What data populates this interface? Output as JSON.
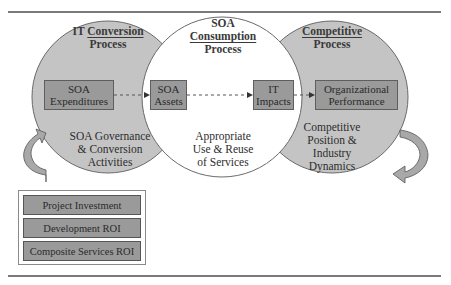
{
  "diagram": {
    "colors": {
      "circle_fill": "#c4c4c4",
      "middle_circle_fill": "#ffffff",
      "circle_stroke": "#6a6a6a",
      "box_fill": "#9a9a9a",
      "box_stroke": "#5e5e5e",
      "arrow_fill": "#a8a8a8",
      "rule": "#7a7a7a"
    },
    "circles": [
      {
        "id": "it-conversion",
        "title_line1_prefix": "IT ",
        "title_line1_underlined": "Conversion",
        "title_line2": "Process",
        "description": [
          "SOA Governance",
          "& Conversion",
          "Activities"
        ]
      },
      {
        "id": "soa-consumption",
        "title_line1": "SOA",
        "title_line2_underlined": "Consumption",
        "title_line3": "Process",
        "description": [
          "Appropriate",
          "Use & Reuse",
          "of Services"
        ]
      },
      {
        "id": "competitive",
        "title_line1_underlined": "Competitive",
        "title_line2": "Process",
        "description": [
          "Competitive",
          "Position &",
          "Industry",
          "Dynamics"
        ]
      }
    ],
    "boxes": [
      {
        "id": "soa-expenditures",
        "lines": [
          "SOA",
          "Expenditures"
        ]
      },
      {
        "id": "soa-assets",
        "lines": [
          "SOA",
          "Assets"
        ]
      },
      {
        "id": "it-impacts",
        "lines": [
          "IT",
          "Impacts"
        ]
      },
      {
        "id": "organizational-performance",
        "lines": [
          "Organizational",
          "Performance"
        ]
      }
    ],
    "flow": [
      "SOA Expenditures",
      "SOA Assets",
      "IT Impacts",
      "Organizational Performance"
    ],
    "legend": {
      "items": [
        "Project Investment",
        "Development ROI",
        "Composite Services ROI"
      ]
    },
    "curved_arrows": [
      {
        "position": "left",
        "direction": "up-right"
      },
      {
        "position": "right",
        "direction": "down-left"
      }
    ]
  }
}
